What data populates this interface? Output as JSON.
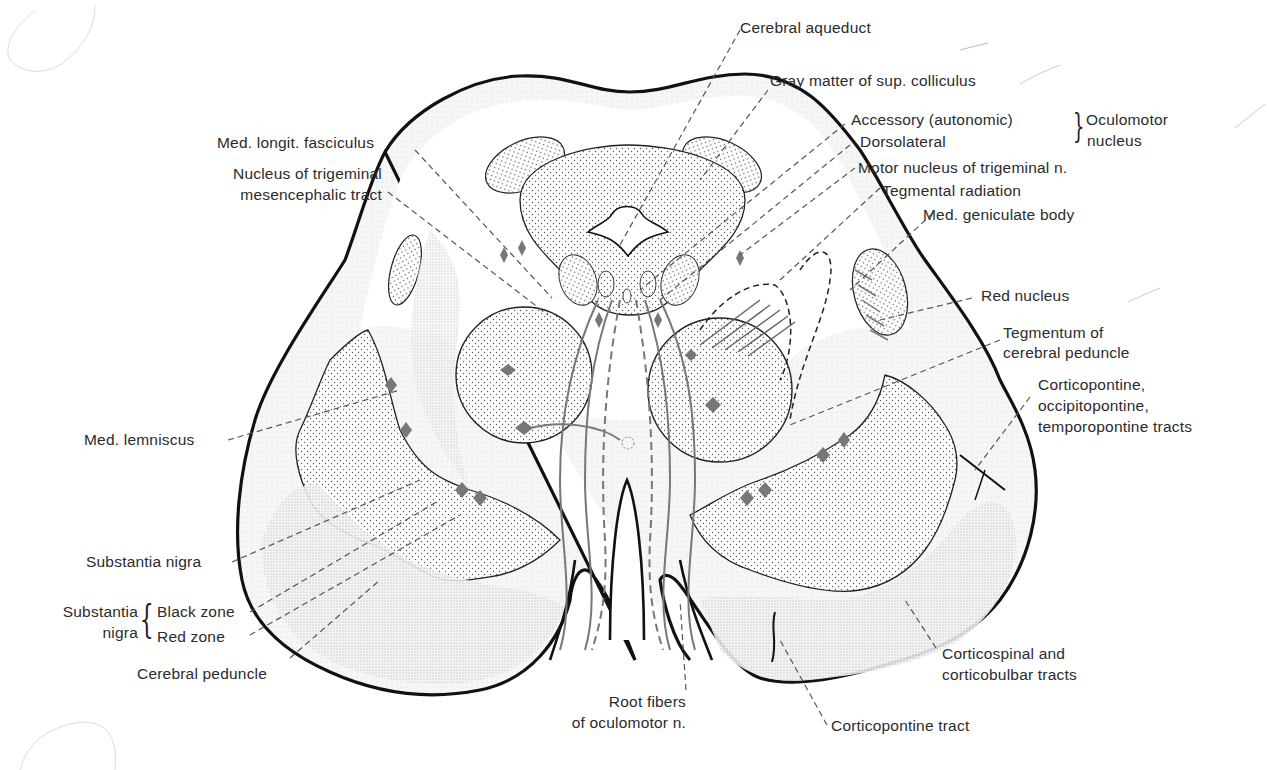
{
  "diagram": {
    "labels": {
      "cerebral_aqueduct": "Cerebral aqueduct",
      "gray_matter_sup_colliculus": "Gray matter of sup. colliculus",
      "accessory_autonomic": "Accessory (autonomic)",
      "dorsolateral": "Dorsolateral",
      "oculomotor_nucleus_line1": "Oculomotor",
      "oculomotor_nucleus_line2": "nucleus",
      "motor_nucleus_trigeminal": "Motor nucleus of trigeminal n.",
      "tegmental_radiation": "Tegmental radiation",
      "med_geniculate_body": "Med. geniculate body",
      "red_nucleus": "Red nucleus",
      "tegmentum_line1": "Tegmentum of",
      "tegmentum_line2": "cerebral peduncle",
      "corticopontine_occ_line1": "Corticopontine,",
      "corticopontine_occ_line2": "occipitopontine,",
      "corticopontine_occ_line3": "temporopontine tracts",
      "corticospinal_line1": "Corticospinal and",
      "corticospinal_line2": "corticobulbar tracts",
      "corticopontine_tract": "Corticopontine tract",
      "root_fibers_line1": "Root fibers",
      "root_fibers_line2": "of oculomotor n.",
      "cerebral_peduncle": "Cerebral peduncle",
      "substantia_nigra_group_line1": "Substantia",
      "substantia_nigra_group_line2": "nigra",
      "black_zone": "Black zone",
      "red_zone": "Red zone",
      "substantia_nigra": "Substantia nigra",
      "med_lemniscus": "Med. lemniscus",
      "med_longit_fasciculus": "Med. longit. fasciculus",
      "nucleus_trig_mes_line1": "Nucleus of trigeminal",
      "nucleus_trig_mes_line2": "mesencephalic tract"
    },
    "colors": {
      "outline": "#111111",
      "leader_line": "#555555",
      "stipple_fill": "#d9d9d9",
      "light_fill": "#efefef",
      "marker": "#777777",
      "text": "#2b2b2b"
    }
  }
}
